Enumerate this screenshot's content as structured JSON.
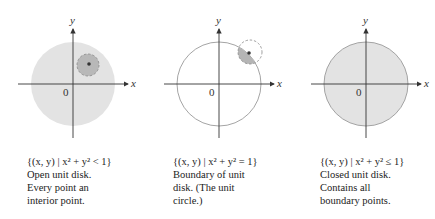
{
  "figure": {
    "panels": [
      {
        "id": "open",
        "axis_x_label": "x",
        "axis_y_label": "y",
        "origin_label": "0",
        "set_notation": "{(x, y) | x² + y² < 1}",
        "caption_lines": [
          "Open unit disk.",
          "Every point an",
          "interior point."
        ]
      },
      {
        "id": "boundary",
        "axis_x_label": "x",
        "axis_y_label": "y",
        "origin_label": "0",
        "set_notation": "{(x, y) | x² + y² = 1}",
        "caption_lines": [
          "Boundary of unit",
          "disk. (The unit",
          "circle.)"
        ]
      },
      {
        "id": "closed",
        "axis_x_label": "x",
        "axis_y_label": "y",
        "origin_label": "0",
        "set_notation": "{(x, y) | x² + y² ≤ 1}",
        "caption_lines": [
          "Closed unit disk.",
          "Contains all",
          "boundary points."
        ]
      }
    ],
    "colors": {
      "disk_fill": "#e3e3e3",
      "neighborhood_fill": "#b5b5b5",
      "axis": "#333333",
      "circle_stroke": "#9a9a9a"
    }
  }
}
